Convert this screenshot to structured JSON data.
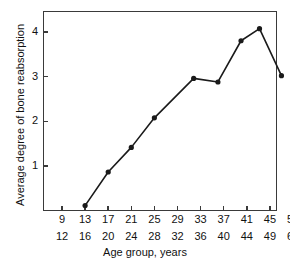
{
  "chart_data": {
    "type": "line",
    "title": "",
    "xlabel": "Age group, years",
    "ylabel": "Average degree of bone reabsorption",
    "grid": false,
    "legend": "none",
    "xlim": [
      0,
      10
    ],
    "ylim": [
      0,
      4.45
    ],
    "yticks": [
      1,
      2,
      3,
      4
    ],
    "ytick_labels": [
      "1",
      "2",
      "3",
      "4"
    ],
    "categories": [
      "9-12",
      "13-16",
      "17-20",
      "21-24",
      "25-28",
      "29-32",
      "33-36",
      "37-40",
      "41-44",
      "45-49",
      "50-60"
    ],
    "xtick_labels_top": [
      "9",
      "13",
      "17",
      "21",
      "25",
      "29",
      "33",
      "37",
      "41",
      "45",
      "50"
    ],
    "xtick_labels_bottom": [
      "12",
      "16",
      "20",
      "24",
      "28",
      "32",
      "36",
      "40",
      "44",
      "49",
      "60"
    ],
    "marker": "filled-circle",
    "line_color": "#1a1a1a",
    "points": [
      {
        "category": "13-16",
        "x_index": 1,
        "value": 0.12
      },
      {
        "category": "17-20",
        "x_index": 2,
        "value": 0.87
      },
      {
        "category": "21-24",
        "x_index": 3,
        "value": 1.42
      },
      {
        "category": "25-28",
        "x_index": 4,
        "value": 2.08
      },
      {
        "category": "33-36",
        "x_index": 5.7,
        "value": 2.96
      },
      {
        "category": "37-40",
        "x_index": 6.75,
        "value": 2.88
      },
      {
        "category": "41-44",
        "x_index": 7.75,
        "value": 3.8
      },
      {
        "category": "45-49",
        "x_index": 8.55,
        "value": 4.07
      },
      {
        "category": "50-60",
        "x_index": 9.5,
        "value": 3.02
      }
    ],
    "values": [
      null,
      0.12,
      0.87,
      1.42,
      2.08,
      null,
      2.96,
      2.88,
      3.8,
      4.07,
      3.02
    ]
  }
}
